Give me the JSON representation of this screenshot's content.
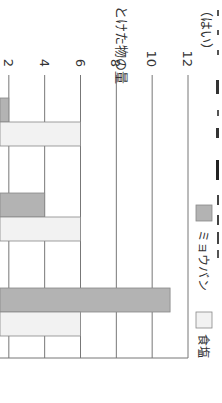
{
  "chart_data": {
    "type": "bar",
    "orientation_note": "rotated 90 degrees clockwise",
    "title": "",
    "ylabel": "とけた物の量",
    "yunit": "（はい）",
    "xlabel": "",
    "ylim": [
      0,
      12
    ],
    "yticks": [
      2,
      4,
      6,
      8,
      10,
      12
    ],
    "categories": [
      "",
      "",
      ""
    ],
    "series": [
      {
        "name": "ミョウバン",
        "color": "#b3b3b3",
        "values": [
          2,
          4,
          11
        ]
      },
      {
        "name": "食塩",
        "color": "#f2f2f2",
        "values": [
          6,
          6,
          6
        ]
      }
    ],
    "legend_position": "top-right",
    "grid": true
  }
}
